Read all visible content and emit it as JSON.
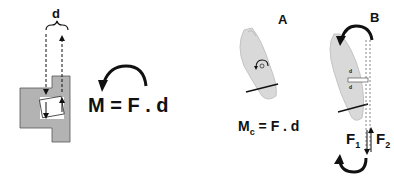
{
  "left_panel": {
    "distance_label": "d",
    "equation": "M = F . d"
  },
  "panel_a": {
    "label": "A",
    "equation_main": "M",
    "equation_sub": "c",
    "equation_rest": " = F . d"
  },
  "panel_b": {
    "label": "B",
    "force_1_main": "F",
    "force_1_sub": "1",
    "force_2_main": "F",
    "force_2_sub": "2",
    "distance_1": "d",
    "distance_2": "d"
  },
  "colors": {
    "bracket_fill": "#b3b3b3",
    "tooth_fill": "#d9d9d9",
    "line": "#111111"
  }
}
